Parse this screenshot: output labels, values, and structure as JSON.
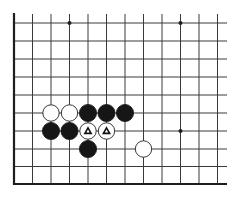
{
  "diagram": {
    "type": "go-board-fragment",
    "colors": {
      "background": "#ffffff",
      "line": "#3a3a3a",
      "edge": "#1e1e1e",
      "black_stone": "#161616",
      "white_stone_fill": "#ffffff",
      "white_stone_stroke": "#222222",
      "marker": "#111111"
    },
    "grid": {
      "columns_x": [
        14,
        32.5,
        51,
        69.5,
        88,
        106.5,
        125,
        143.5,
        162,
        180.5,
        199,
        217.5
      ],
      "rows_y": [
        23,
        41,
        59,
        77,
        95,
        113,
        131,
        149,
        166.5,
        184
      ],
      "vertical_top": 14,
      "horizontal_right": 227,
      "left_edge": true,
      "bottom_edge": true
    },
    "star_points": [
      {
        "col": 3,
        "row": 0
      },
      {
        "col": 9,
        "row": 0
      },
      {
        "col": 9,
        "row": 6
      }
    ],
    "stones": [
      {
        "color": "white",
        "col": 2,
        "row": 5,
        "marker": ""
      },
      {
        "color": "white",
        "col": 3,
        "row": 5,
        "marker": ""
      },
      {
        "color": "black",
        "col": 4,
        "row": 5,
        "marker": ""
      },
      {
        "color": "black",
        "col": 5,
        "row": 5,
        "marker": ""
      },
      {
        "color": "black",
        "col": 6,
        "row": 5,
        "marker": ""
      },
      {
        "color": "black",
        "col": 2,
        "row": 6,
        "marker": ""
      },
      {
        "color": "black",
        "col": 3,
        "row": 6,
        "marker": ""
      },
      {
        "color": "white",
        "col": 4,
        "row": 6,
        "marker": "triangle"
      },
      {
        "color": "white",
        "col": 5,
        "row": 6,
        "marker": "triangle"
      },
      {
        "color": "black",
        "col": 4,
        "row": 7,
        "marker": ""
      },
      {
        "color": "white",
        "col": 7,
        "row": 7,
        "marker": ""
      }
    ],
    "stone_radius": 8.6
  }
}
